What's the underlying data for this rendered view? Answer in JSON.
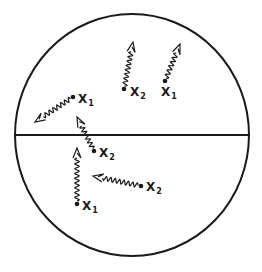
{
  "diagram": {
    "colors": {
      "stroke": "#1a1a1a",
      "background": "#ffffff"
    },
    "circle": {
      "cx": 132,
      "cy": 135,
      "rx": 117,
      "ry": 121
    },
    "divider": {
      "x1": 15,
      "x2": 249,
      "y": 135
    },
    "particles": [
      {
        "id": "p1",
        "label": "X",
        "sub": "1",
        "dot": [
          73,
          97
        ],
        "label_pos": [
          78,
          103
        ],
        "arrow_tip": [
          35,
          122
        ]
      },
      {
        "id": "p2",
        "label": "X",
        "sub": "2",
        "dot": [
          124,
          89
        ],
        "label_pos": [
          130,
          96
        ],
        "arrow_tip": [
          133,
          42
        ]
      },
      {
        "id": "p3",
        "label": "X",
        "sub": "1",
        "dot": [
          165,
          81
        ],
        "label_pos": [
          161,
          96
        ],
        "arrow_tip": [
          180,
          44
        ]
      },
      {
        "id": "p4",
        "label": "X",
        "sub": "2",
        "dot": [
          94,
          151
        ],
        "label_pos": [
          99,
          157
        ],
        "arrow_tip": [
          77,
          117
        ]
      },
      {
        "id": "p5",
        "label": "X",
        "sub": "1",
        "dot": [
          77,
          204
        ],
        "label_pos": [
          82,
          210
        ],
        "arrow_tip": [
          77,
          148
        ]
      },
      {
        "id": "p6",
        "label": "X",
        "sub": "2",
        "dot": [
          141,
          186
        ],
        "label_pos": [
          146,
          191
        ],
        "arrow_tip": [
          93,
          176
        ]
      }
    ]
  }
}
